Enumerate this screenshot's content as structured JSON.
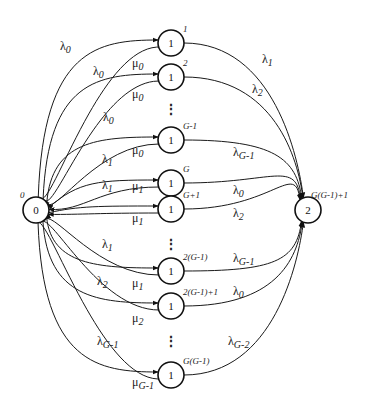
{
  "diagram": {
    "type": "state-transition-diagram",
    "states": {
      "left": {
        "label": "0",
        "index": "0"
      },
      "right": {
        "label": "2",
        "index": "G(G-1)+1"
      },
      "middle": [
        {
          "label": "1",
          "index": "1",
          "lambda_in": "0",
          "mu_out": "0",
          "lambda_right": "1"
        },
        {
          "label": "1",
          "index": "2",
          "lambda_in": "0",
          "mu_out": "0",
          "lambda_right": "2"
        },
        {
          "label": "1",
          "index": "G-1",
          "lambda_in": "0",
          "mu_out": "0",
          "lambda_right": "G-1"
        },
        {
          "label": "1",
          "index": "G",
          "lambda_in": "1",
          "mu_out": "1",
          "lambda_right": "0"
        },
        {
          "label": "1",
          "index": "G+1",
          "lambda_in": "1",
          "mu_out": "1",
          "lambda_right": "2"
        },
        {
          "label": "1",
          "index": "2(G-1)",
          "lambda_in": "1",
          "mu_out": "1",
          "lambda_right": "G-1"
        },
        {
          "label": "1",
          "index": "2(G-1)+1",
          "lambda_in": "2",
          "mu_out": "2",
          "lambda_right": "0"
        },
        {
          "label": "1",
          "index": "G(G-1)",
          "lambda_in": "G-1",
          "mu_out": "G-1",
          "lambda_right": "G-2"
        }
      ]
    },
    "ellipsis": "⋮",
    "symbols": {
      "lambda": "λ",
      "mu": "μ"
    }
  }
}
